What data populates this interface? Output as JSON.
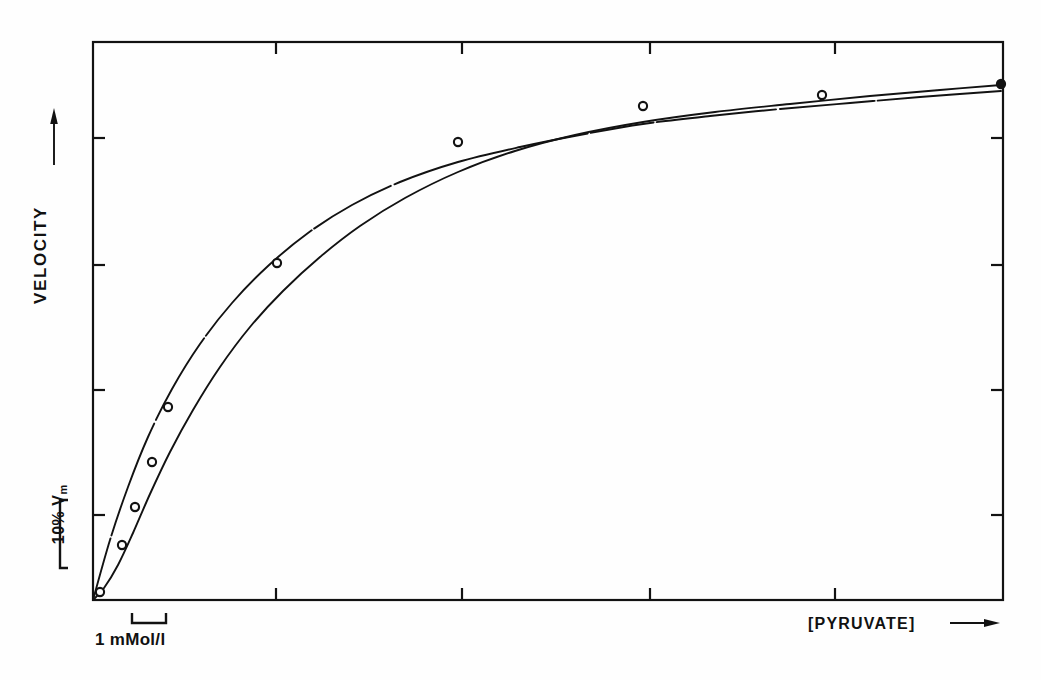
{
  "figure": {
    "background": "#fefefe",
    "ink_color": "#121212"
  },
  "axes": {
    "y_title": "VELOCITY",
    "y_title_arrow": "up-arrow",
    "x_title": "[PYRUVATE]",
    "x_title_arrow": "right-arrow",
    "y_scale_bar_label": "10% V",
    "y_scale_bar_sub": "m",
    "x_scale_bar_label": "1 mMol/l",
    "frame": {
      "left": 93,
      "right": 1003,
      "top": 42,
      "bottom": 600
    },
    "x_ticks": [
      276,
      462,
      650,
      835
    ],
    "y_ticks": [
      138,
      265,
      390,
      515
    ],
    "tick_length": 12,
    "frame_width": 2.2
  },
  "chart_data": {
    "type": "line",
    "title": "",
    "xlabel": "[PYRUVATE]",
    "ylabel": "VELOCITY",
    "xlim": [
      0,
      4.9
    ],
    "ylim": [
      0,
      1.0
    ],
    "x_unit": "mMol/l",
    "y_unit": "fraction of Vm",
    "grid": false,
    "legend": "none",
    "x_scale_bar_mmol": 1,
    "y_scale_bar_percent_vm": 10,
    "series": [
      {
        "name": "hyperbolic",
        "marker": "open-circle",
        "line_style": "broken-ink",
        "points_px": [
          [
            93,
            600
          ],
          [
            110,
            540
          ],
          [
            128,
            487
          ],
          [
            148,
            437
          ],
          [
            172,
            389
          ],
          [
            200,
            344
          ],
          [
            232,
            303
          ],
          [
            268,
            266
          ],
          [
            308,
            233
          ],
          [
            352,
            205
          ],
          [
            400,
            182
          ],
          [
            458,
            162
          ],
          [
            520,
            147
          ],
          [
            585,
            134
          ],
          [
            643,
            124
          ],
          [
            710,
            116
          ],
          [
            780,
            109
          ],
          [
            850,
            103
          ],
          [
            920,
            97
          ],
          [
            1001,
            91
          ]
        ],
        "marker_points_px": [],
        "x_mmol": [
          0,
          0.1,
          0.2,
          0.3,
          0.45,
          0.6,
          0.78,
          0.98,
          1.2,
          1.45,
          1.7,
          2.0,
          2.35,
          2.7,
          3.05,
          3.4,
          3.8,
          4.2,
          4.55,
          4.9
        ],
        "y_frac": [
          0.0,
          0.107,
          0.202,
          0.292,
          0.378,
          0.459,
          0.532,
          0.599,
          0.658,
          0.708,
          0.749,
          0.785,
          0.812,
          0.835,
          0.853,
          0.867,
          0.88,
          0.891,
          0.902,
          0.912
        ]
      },
      {
        "name": "sigmoidal",
        "marker": "open-circle",
        "line_style": "solid",
        "points_px": [
          [
            93,
            600
          ],
          [
            104,
            588
          ],
          [
            118,
            565
          ],
          [
            133,
            533
          ],
          [
            150,
            494
          ],
          [
            170,
            452
          ],
          [
            193,
            410
          ],
          [
            220,
            367
          ],
          [
            250,
            327
          ],
          [
            283,
            291
          ],
          [
            320,
            257
          ],
          [
            360,
            226
          ],
          [
            405,
            198
          ],
          [
            458,
            172
          ],
          [
            515,
            151
          ],
          [
            575,
            135
          ],
          [
            643,
            122
          ],
          [
            715,
            112
          ],
          [
            790,
            104
          ],
          [
            870,
            96
          ],
          [
            940,
            90
          ],
          [
            1001,
            85
          ]
        ],
        "marker_points_px": [
          [
            100,
            592
          ],
          [
            122,
            545
          ],
          [
            135,
            507
          ],
          [
            152,
            462
          ],
          [
            168,
            407
          ],
          [
            277,
            263
          ],
          [
            458,
            142
          ],
          [
            643,
            106
          ],
          [
            822,
            95
          ],
          [
            1001,
            84
          ]
        ],
        "x_mmol": [
          0,
          0.06,
          0.14,
          0.22,
          0.31,
          0.42,
          0.54,
          0.68,
          0.85,
          1.03,
          1.22,
          1.44,
          1.69,
          1.98,
          2.29,
          2.62,
          3.0,
          3.4,
          3.8,
          4.25,
          4.6,
          4.9
        ],
        "y_frac": [
          0.0,
          0.021,
          0.063,
          0.12,
          0.19,
          0.265,
          0.34,
          0.417,
          0.489,
          0.553,
          0.614,
          0.67,
          0.72,
          0.767,
          0.804,
          0.833,
          0.856,
          0.874,
          0.888,
          0.903,
          0.914,
          0.923
        ]
      }
    ]
  }
}
